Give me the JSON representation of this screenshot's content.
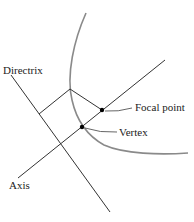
{
  "diagram": {
    "labels": {
      "directrix": "Directrix",
      "focal_point": "Focal point",
      "vertex": "Vertex",
      "axis": "Axis"
    },
    "colors": {
      "curve": "#8a8a8a",
      "lines": "#333333",
      "points": "#000000",
      "text": "#222222"
    }
  }
}
